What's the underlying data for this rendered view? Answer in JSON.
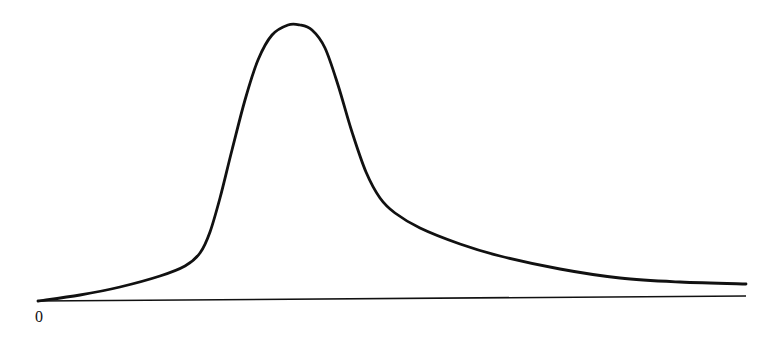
{
  "chart_data": {
    "type": "line",
    "title": "",
    "xlabel": "",
    "ylabel": "",
    "x_tick_labels": [
      "0"
    ],
    "legend": [],
    "grid": false,
    "series": [
      {
        "name": "curve",
        "color": "#111111",
        "points_px": [
          [
            38,
            301
          ],
          [
            80,
            295
          ],
          [
            120,
            287
          ],
          [
            160,
            276
          ],
          [
            185,
            266
          ],
          [
            200,
            253
          ],
          [
            210,
            232
          ],
          [
            220,
            198
          ],
          [
            232,
            150
          ],
          [
            245,
            100
          ],
          [
            258,
            60
          ],
          [
            272,
            35
          ],
          [
            288,
            25
          ],
          [
            300,
            25
          ],
          [
            312,
            30
          ],
          [
            325,
            48
          ],
          [
            338,
            85
          ],
          [
            352,
            132
          ],
          [
            366,
            172
          ],
          [
            380,
            198
          ],
          [
            395,
            213
          ],
          [
            420,
            228
          ],
          [
            460,
            244
          ],
          [
            500,
            256
          ],
          [
            560,
            269
          ],
          [
            620,
            278
          ],
          [
            680,
            282
          ],
          [
            746,
            284
          ]
        ]
      }
    ],
    "axis": {
      "baseline_start_px": [
        38,
        301
      ],
      "baseline_end_px": [
        746,
        296
      ],
      "color": "#111111"
    },
    "origin_label": "0"
  }
}
